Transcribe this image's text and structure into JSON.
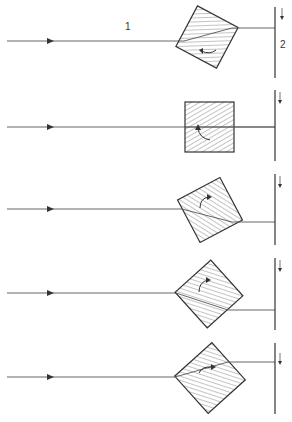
{
  "figure": {
    "labels": {
      "ray_label": "1",
      "screen_label": "2"
    },
    "colors": {
      "line": "#444444",
      "background": "#ffffff"
    },
    "panels": [
      {
        "id": 1,
        "ray_y": 41,
        "prism_cx": 207,
        "prism_cy": 37,
        "prism_size": 46,
        "rotation_deg": 28,
        "exit_y": 27,
        "rotation_arrow": "counterclockwise"
      },
      {
        "id": 2,
        "ray_y": 127,
        "prism_cx": 208,
        "prism_cy": 126,
        "prism_size": 50,
        "rotation_deg": 0,
        "exit_y": 127,
        "rotation_arrow": "counterclockwise"
      },
      {
        "id": 3,
        "ray_y": 209,
        "prism_cx": 210,
        "prism_cy": 210,
        "prism_size": 48,
        "rotation_deg": -28,
        "exit_y": 222,
        "rotation_arrow": "clockwise"
      },
      {
        "id": 4,
        "ray_y": 293,
        "prism_cx": 209,
        "prism_cy": 294,
        "prism_size": 48,
        "rotation_deg": -42,
        "exit_y": 310,
        "rotation_arrow": "clockwise"
      },
      {
        "id": 5,
        "ray_y": 377,
        "prism_cx": 209,
        "prism_cy": 378,
        "prism_size": 50,
        "rotation_deg": 40,
        "exit_y": 361,
        "rotation_arrow": "clockwise"
      }
    ]
  }
}
